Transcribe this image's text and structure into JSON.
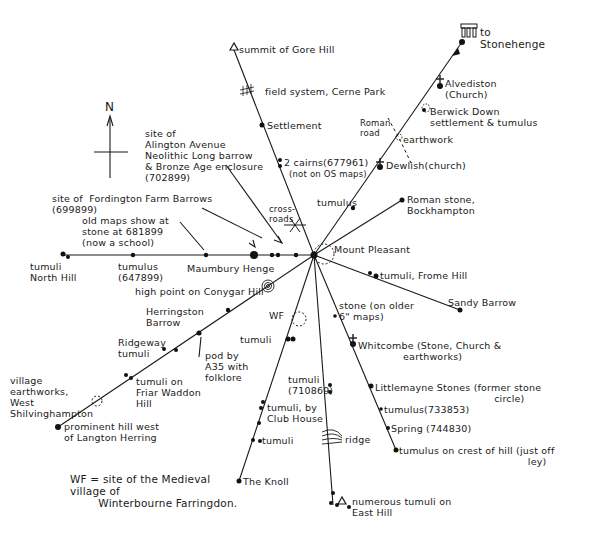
{
  "map": {
    "title": "Ley lines radiating from Mount Pleasant",
    "hub": {
      "name": "Mount Pleasant",
      "x": 314,
      "y": 255
    },
    "compass": {
      "label": "N"
    },
    "colors": {
      "ink": "#1a1a1a",
      "paper": "#ffffff"
    },
    "labels": {
      "gore_hill": "summit of Gore Hill",
      "cerne_park": "field system, Cerne Park",
      "settlement": "Settlement",
      "cairns": "2 cairns(677961)",
      "cairns_note": "(not on OS maps)",
      "cross_roads": "cross-\nroads",
      "tumulus_ne": "tumulus",
      "stonehenge": "to\nStonehenge",
      "alvediston": "Alvediston\n(Church)",
      "berwick": "Berwick Down\nsettlement & tumulus",
      "roman_road": "Roman\nroad",
      "earthwork": "earthwork",
      "dewlish": "Dewlish(church)",
      "roman_stone": "Roman stone,\nBockhampton",
      "mount_pleasant": "Mount Pleasant",
      "frome_hill": "tumuli, Frome Hill",
      "sandy_barrow": "Sandy Barrow",
      "alington": "site of\nAlington Avenue\nNeolithic Long barrow\n& Bronze Age enclosure\n(702899)",
      "fordington": "site of  Fordington Farm Barrows\n(699899)",
      "old_maps": "old maps show at\nstone at 681899\n(now a school)",
      "north_hill": "tumuli\nNorth Hill",
      "tumulus_w": "tumulus\n(647899)",
      "maumbury": "Maumbury Henge",
      "conygar": "high point on Conygar Hill",
      "herringston": "Herringston\nBarrow",
      "wf": "WF",
      "ridgeway": "Ridgeway\ntumuli",
      "pond": "pod by\nA35 with\nfolklore",
      "tumuli_mid": "tumuli",
      "friar_waddon": "tumuli on\nFriar Waddon\nHill",
      "shilvinghampton": "village\nearthworks,\nWest\nShilvinghampton",
      "langton": "prominent hill west\nof Langton Herring",
      "wf_note": "WF = site of the Medieval\nvillage of\n        Winterbourne Farringdon.",
      "tumuli_710869": "tumuli\n(710869)",
      "club_house": "tumuli, by\nClub House",
      "tumuli_s": "tumuli",
      "the_knoll": "The Knoll",
      "ridge": "ridge",
      "east_hill": "numerous tumuli on\nEast Hill",
      "stone_older": "stone (on older\n6\" maps)",
      "whitcombe": "Whitcombe (Stone, Church &\n              earthworks)",
      "littlemayne": "Littlemayne Stones (former stone\n                                     circle)",
      "tumulus_733853": "tumulus(733853)",
      "spring": "Spring (744830)",
      "crest": "tumulus on crest of hill (just off\n                                        ley)"
    }
  }
}
